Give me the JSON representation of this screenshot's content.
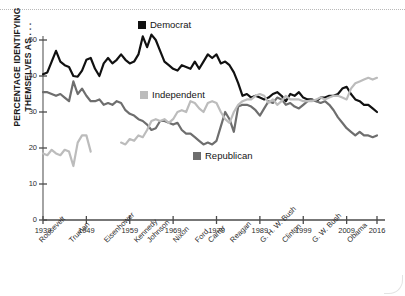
{
  "chart_data": {
    "type": "line",
    "title": "",
    "xlabel": "",
    "ylabel": "PERCENTAGE IDENTIFYING THEMSELVES AS . . .",
    "xlim": [
      1939,
      2016
    ],
    "ylim": [
      0,
      53
    ],
    "yticks": [
      0,
      10,
      20,
      30,
      40,
      50
    ],
    "xticks": [
      1939,
      1949,
      1959,
      1969,
      1979,
      1989,
      1999,
      2009,
      2016
    ],
    "grid": false,
    "legend_position": "inside",
    "legend": [
      {
        "name": "Democrat",
        "color": "#111111"
      },
      {
        "name": "Independent",
        "color": "#bcbcbc"
      },
      {
        "name": "Republican",
        "color": "#6e6e6e"
      }
    ],
    "era_labels": [
      {
        "label": "Roosevelt",
        "year": 1939
      },
      {
        "label": "Truman",
        "year": 1946
      },
      {
        "label": "Eisenhower",
        "year": 1954
      },
      {
        "label": "Kennedy",
        "year": 1961
      },
      {
        "label": "Johnson",
        "year": 1964
      },
      {
        "label": "Nixon",
        "year": 1970
      },
      {
        "label": "Ford",
        "year": 1975
      },
      {
        "label": "Carter",
        "year": 1978
      },
      {
        "label": "Reagan",
        "year": 1983
      },
      {
        "label": "G. H. W. Bush",
        "year": 1990
      },
      {
        "label": "Clinton",
        "year": 1995
      },
      {
        "label": "G. W. Bush",
        "year": 2002
      },
      {
        "label": "Obama",
        "year": 2010
      }
    ],
    "series": [
      {
        "name": "Democrat",
        "color": "#111111",
        "x": [
          1939,
          1940,
          1941,
          1942,
          1943,
          1944,
          1945,
          1946,
          1947,
          1948,
          1949,
          1950,
          1951,
          1952,
          1953,
          1954,
          1955,
          1956,
          1957,
          1958,
          1959,
          1960,
          1961,
          1962,
          1963,
          1964,
          1965,
          1966,
          1967,
          1968,
          1969,
          1970,
          1971,
          1972,
          1973,
          1974,
          1975,
          1976,
          1977,
          1978,
          1979,
          1980,
          1981,
          1982,
          1983,
          1984,
          1985,
          1986,
          1987,
          1988,
          1989,
          1990,
          1991,
          1992,
          1993,
          1994,
          1995,
          1996,
          1997,
          1998,
          1999,
          2000,
          2001,
          2002,
          2003,
          2004,
          2005,
          2006,
          2007,
          2008,
          2009,
          2010,
          2011,
          2012,
          2013,
          2014,
          2015,
          2016
        ],
        "values": [
          40.5,
          41.0,
          44.0,
          47.0,
          44.0,
          43.0,
          42.5,
          40.0,
          39.8,
          41.5,
          44.5,
          45.0,
          42.0,
          40.0,
          43.5,
          45.0,
          43.5,
          44.5,
          46.0,
          44.5,
          43.5,
          44.0,
          46.0,
          51.0,
          48.0,
          51.5,
          50.0,
          47.0,
          44.0,
          43.0,
          42.0,
          41.5,
          43.0,
          42.5,
          42.0,
          44.0,
          42.0,
          44.0,
          46.0,
          45.0,
          46.0,
          43.5,
          44.0,
          43.0,
          41.0,
          38.0,
          34.5,
          35.0,
          34.0,
          34.5,
          34.0,
          33.5,
          34.0,
          35.0,
          35.5,
          34.5,
          33.0,
          35.0,
          34.5,
          35.5,
          34.0,
          33.5,
          33.5,
          33.0,
          34.0,
          34.0,
          34.5,
          34.5,
          35.0,
          36.5,
          37.0,
          35.0,
          33.5,
          33.0,
          32.0,
          32.0,
          31.0,
          30.0
        ]
      },
      {
        "name": "Republican",
        "color": "#6e6e6e",
        "x": [
          1939,
          1940,
          1941,
          1942,
          1943,
          1944,
          1945,
          1946,
          1947,
          1948,
          1949,
          1950,
          1951,
          1952,
          1953,
          1954,
          1955,
          1956,
          1957,
          1958,
          1959,
          1960,
          1961,
          1962,
          1963,
          1964,
          1965,
          1966,
          1967,
          1968,
          1969,
          1970,
          1971,
          1972,
          1973,
          1974,
          1975,
          1976,
          1977,
          1978,
          1979,
          1980,
          1981,
          1982,
          1983,
          1984,
          1985,
          1986,
          1987,
          1988,
          1989,
          1990,
          1991,
          1992,
          1993,
          1994,
          1995,
          1996,
          1997,
          1998,
          1999,
          2000,
          2001,
          2002,
          2003,
          2004,
          2005,
          2006,
          2007,
          2008,
          2009,
          2010,
          2011,
          2012,
          2013,
          2014,
          2015,
          2016
        ],
        "values": [
          35.5,
          35.5,
          35.0,
          34.5,
          35.0,
          34.0,
          33.0,
          38.5,
          35.0,
          36.5,
          34.5,
          33.0,
          33.0,
          33.5,
          32.0,
          32.5,
          32.0,
          33.0,
          32.5,
          30.5,
          29.5,
          29.0,
          28.0,
          27.5,
          26.5,
          25.0,
          25.5,
          27.5,
          27.5,
          27.0,
          26.5,
          27.0,
          25.0,
          24.0,
          24.0,
          23.0,
          22.0,
          21.0,
          21.5,
          21.0,
          22.0,
          26.0,
          30.0,
          28.0,
          24.5,
          31.5,
          32.0,
          32.0,
          31.5,
          30.5,
          29.0,
          31.0,
          33.0,
          32.5,
          34.0,
          33.5,
          32.0,
          32.5,
          31.5,
          31.0,
          32.0,
          33.0,
          33.5,
          33.0,
          32.5,
          33.0,
          32.0,
          30.5,
          28.5,
          27.0,
          25.5,
          24.5,
          23.5,
          24.5,
          23.5,
          23.5,
          23.0,
          23.5
        ]
      },
      {
        "name": "Independent",
        "color": "#bcbcbc",
        "x": [
          1939,
          1940,
          1941,
          1942,
          1943,
          1944,
          1945,
          1946,
          1947,
          1948,
          1949,
          1950,
          1957,
          1958,
          1959,
          1960,
          1961,
          1962,
          1963,
          1964,
          1965,
          1966,
          1967,
          1968,
          1969,
          1970,
          1971,
          1972,
          1973,
          1974,
          1975,
          1976,
          1977,
          1978,
          1979,
          1980,
          1981,
          1982,
          1983,
          1984,
          1985,
          1986,
          1987,
          1988,
          1989,
          1990,
          1991,
          1992,
          1993,
          1994,
          1995,
          1996,
          1997,
          1998,
          1999,
          2000,
          2001,
          2002,
          2003,
          2004,
          2005,
          2006,
          2007,
          2008,
          2009,
          2010,
          2011,
          2012,
          2013,
          2014,
          2015,
          2016
        ],
        "values": [
          18.5,
          18.0,
          19.5,
          18.5,
          18.0,
          19.5,
          19.0,
          15.0,
          21.5,
          23.5,
          23.5,
          19.0,
          21.5,
          21.0,
          22.5,
          22.0,
          23.5,
          23.0,
          25.0,
          27.5,
          28.0,
          27.5,
          28.0,
          27.0,
          28.0,
          30.0,
          30.5,
          30.0,
          33.0,
          32.5,
          31.0,
          30.0,
          32.5,
          33.0,
          32.5,
          30.0,
          28.0,
          27.0,
          30.0,
          32.0,
          33.0,
          33.5,
          33.5,
          34.5,
          35.0,
          34.5,
          32.5,
          33.5,
          32.0,
          33.0,
          34.5,
          33.5,
          33.5,
          33.5,
          33.0,
          33.0,
          33.0,
          33.5,
          34.0,
          33.5,
          34.0,
          34.5,
          34.5,
          34.0,
          33.5,
          36.5,
          38.0,
          38.5,
          39.0,
          39.5,
          39.0,
          39.5
        ]
      }
    ]
  }
}
